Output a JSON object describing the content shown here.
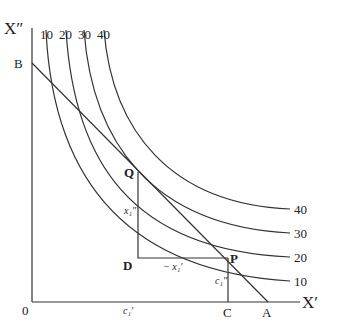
{
  "diagram": {
    "axes": {
      "y_label": "X″",
      "x_label": "X′",
      "origin": "0"
    },
    "curve_labels_top": [
      "10",
      "20",
      "30",
      "40"
    ],
    "curve_labels_right": [
      "40",
      "30",
      "20",
      "10"
    ],
    "points": {
      "B": "B",
      "A": "A",
      "Q": "Q",
      "D": "D",
      "P": "P",
      "C": "C"
    },
    "annotations": {
      "vertical_change": "x₁″",
      "horizontal_change": "− x₁′",
      "c_double_prime": "c₁″",
      "c_prime": "c₁′"
    }
  }
}
